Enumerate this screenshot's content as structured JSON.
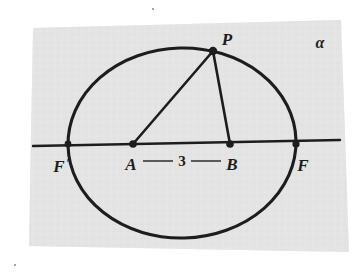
{
  "figure": {
    "type": "geometry-diagram",
    "plane_label": "α",
    "background_color": "#ffffff",
    "plane_fill": "#e3e3e3",
    "ink_color": "#1d1d1d",
    "labels": {
      "point_p": "P",
      "point_a": "A",
      "point_b": "B",
      "focus_left": "F",
      "focus_left_prime": "′",
      "focus_right": "F",
      "measure": "3",
      "plane": "α"
    },
    "points": [
      {
        "name": "F'",
        "x": 68,
        "y": 144,
        "kind": "axis-intersection"
      },
      {
        "name": "A",
        "x": 133,
        "y": 144,
        "kind": "interior-point"
      },
      {
        "name": "B",
        "x": 230,
        "y": 144,
        "kind": "interior-point"
      },
      {
        "name": "F",
        "x": 296,
        "y": 144,
        "kind": "axis-intersection"
      },
      {
        "name": "P",
        "x": 213,
        "y": 51,
        "kind": "on-curve"
      }
    ],
    "segments": [
      {
        "name": "PA",
        "from": "P",
        "to": "A"
      },
      {
        "name": "PB",
        "from": "P",
        "to": "B"
      },
      {
        "name": "AB-measure",
        "from": "A",
        "to": "B",
        "label": "3"
      }
    ],
    "ellipse": {
      "center_x": 182,
      "center_y": 143,
      "radius_x": 114,
      "radius_y": 95,
      "rotation_deg": -1.5
    },
    "axis_line": {
      "x1": 33,
      "y1": 146,
      "x2": 340,
      "y2": 140
    }
  }
}
